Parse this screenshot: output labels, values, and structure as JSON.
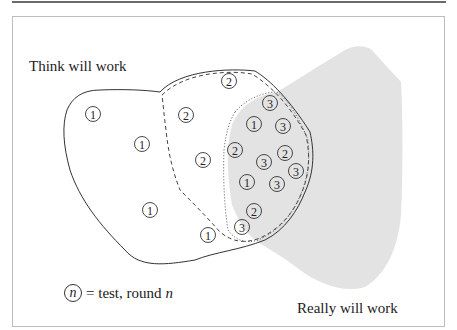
{
  "diagram": {
    "labels": {
      "think_will_work": "Think will work",
      "really_will_work": "Really will work"
    },
    "legend": {
      "symbol": "n",
      "text": "= test, round",
      "var": "n"
    },
    "colors": {
      "really_region_fill": "#e3e3e3",
      "outline": "#333333",
      "frame": "#bdbdbd"
    },
    "tests": [
      {
        "round": "1",
        "x": 93,
        "y": 114
      },
      {
        "round": "1",
        "x": 142,
        "y": 144
      },
      {
        "round": "1",
        "x": 150,
        "y": 210
      },
      {
        "round": "1",
        "x": 208,
        "y": 235
      },
      {
        "round": "1",
        "x": 254,
        "y": 124
      },
      {
        "round": "1",
        "x": 247,
        "y": 182
      },
      {
        "round": "2",
        "x": 229,
        "y": 81
      },
      {
        "round": "2",
        "x": 186,
        "y": 115
      },
      {
        "round": "2",
        "x": 203,
        "y": 160
      },
      {
        "round": "2",
        "x": 235,
        "y": 150
      },
      {
        "round": "2",
        "x": 285,
        "y": 153
      },
      {
        "round": "2",
        "x": 254,
        "y": 211
      },
      {
        "round": "3",
        "x": 270,
        "y": 103
      },
      {
        "round": "3",
        "x": 283,
        "y": 126
      },
      {
        "round": "3",
        "x": 264,
        "y": 162
      },
      {
        "round": "3",
        "x": 277,
        "y": 184
      },
      {
        "round": "3",
        "x": 296,
        "y": 171
      },
      {
        "round": "3",
        "x": 242,
        "y": 227
      }
    ]
  }
}
